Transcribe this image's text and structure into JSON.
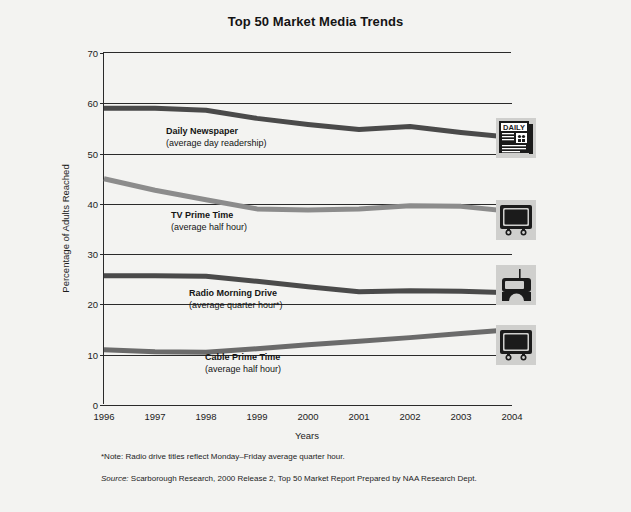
{
  "chart_data": {
    "type": "line",
    "title": "Top 50 Market Media Trends",
    "xlabel": "Years",
    "ylabel": "Percentage of Adults Reached",
    "categories": [
      "1996",
      "1997",
      "1998",
      "1999",
      "2000",
      "2001",
      "2002",
      "2003",
      "2004"
    ],
    "x": [
      1996,
      1997,
      1998,
      1999,
      2000,
      2001,
      2002,
      2003,
      2004
    ],
    "xlim": [
      1996,
      2004
    ],
    "ylim": [
      0,
      70
    ],
    "yticks": [
      0,
      10,
      20,
      30,
      40,
      50,
      60,
      70
    ],
    "grid": true,
    "legend_position": "inline-labels",
    "series": [
      {
        "name": "Daily Newspaper",
        "sublabel": "(average day readership)",
        "color": "#4a4a4a",
        "icon": "newspaper-icon",
        "values": [
          59.0,
          59.0,
          58.6,
          57.0,
          55.8,
          54.8,
          55.4,
          54.2,
          53.2
        ]
      },
      {
        "name": "TV Prime Time",
        "sublabel": "(average half hour)",
        "color": "#8c8c8c",
        "icon": "television-icon",
        "values": [
          45.0,
          42.7,
          40.8,
          39.0,
          38.8,
          39.0,
          39.6,
          39.5,
          38.5
        ]
      },
      {
        "name": "Radio Morning Drive",
        "sublabel": "(average quarter hour*)",
        "color": "#4a4a4a",
        "icon": "radio-icon",
        "values": [
          25.7,
          25.7,
          25.6,
          24.6,
          23.5,
          22.5,
          22.7,
          22.6,
          22.3
        ]
      },
      {
        "name": "Cable Prime Time",
        "sublabel": "(average half hour)",
        "color": "#6b6b6b",
        "icon": "cable-television-icon",
        "values": [
          11.0,
          10.6,
          10.5,
          11.2,
          12.0,
          12.7,
          13.4,
          14.2,
          15.0
        ]
      }
    ]
  },
  "icon_labels": {
    "newspaper_masthead": "DAILY"
  },
  "footnotes": {
    "note": "*Note: Radio drive titles reflect Monday–Friday average quarter hour.",
    "source_word": "Source:",
    "source_text": " Scarborough Research, 2000 Release 2, Top 50 Market Report Prepared by NAA Research Dept."
  }
}
